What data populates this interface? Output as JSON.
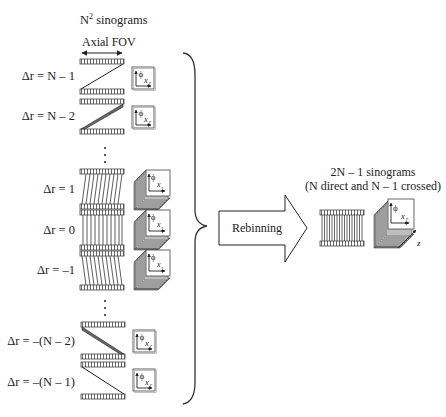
{
  "title_base": "N",
  "title_sup": "2",
  "title_rest": " sinograms",
  "axial_fov": "Axial FOV",
  "rows": [
    {
      "label": "Δr = N – 1",
      "type": "oblique",
      "top": 61,
      "bottom": 92,
      "direction": "up"
    },
    {
      "label": "Δr = N – 2",
      "type": "oblique",
      "top": 102,
      "bottom": 132,
      "direction": "up"
    },
    {
      "label": "Δr = 1",
      "type": "stack",
      "top": 172,
      "bottom": 206,
      "direction": "slant-right"
    },
    {
      "label": "Δr = 0",
      "type": "stack",
      "top": 212,
      "bottom": 248,
      "direction": "straight"
    },
    {
      "label": "Δr = –1",
      "type": "stack",
      "top": 253,
      "bottom": 288,
      "direction": "slant-left"
    },
    {
      "label": "Δr = –(N – 2)",
      "type": "oblique",
      "top": 323,
      "bottom": 357,
      "direction": "down"
    },
    {
      "label": "Δr = –(N – 1)",
      "type": "oblique",
      "top": 363,
      "bottom": 397,
      "direction": "down"
    }
  ],
  "ellipsis": "⋮",
  "sinogram_axes": {
    "phi": "ϕ",
    "xr": "x",
    "xr_sub": "r",
    "z": "z"
  },
  "rebinning_label": "Rebinning",
  "output": {
    "line1": "2N – 1 sinograms",
    "line2": "(N direct and N – 1 crossed)"
  }
}
